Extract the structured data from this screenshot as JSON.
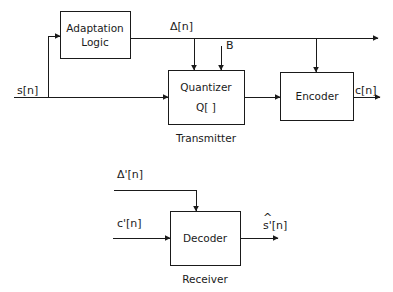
{
  "diagram": {
    "line_color": "#1a1a1a",
    "background_color": "#ffffff",
    "sections": [
      {
        "id": "transmitter",
        "label": "Transmitter"
      },
      {
        "id": "receiver",
        "label": "Receiver"
      }
    ],
    "blocks": [
      {
        "id": "adaptation-logic",
        "line1": "Adaptation",
        "line2": "Logic"
      },
      {
        "id": "quantizer",
        "line1": "Quantizer",
        "line2": "Q[  ]"
      },
      {
        "id": "encoder",
        "line1": "Encoder",
        "line2": ""
      },
      {
        "id": "decoder",
        "line1": "Decoder",
        "line2": ""
      }
    ],
    "signals": {
      "input_s": "s[n]",
      "step_size": "Δ[n]",
      "bits": "B",
      "code_out": "c[n]",
      "step_size_prime": "Δ'[n]",
      "code_in_prime": "c'[n]",
      "recon_hat_s": "s'[n]",
      "recon_hat_accent": "^"
    }
  }
}
